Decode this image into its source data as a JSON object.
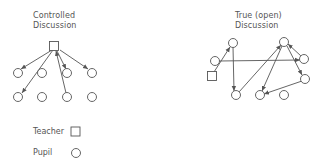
{
  "diagrams": [
    {
      "id": "controlled",
      "title_lines": [
        "Controlled",
        "Discussion"
      ],
      "teacher": {
        "x": 54,
        "y": 46
      },
      "pupils": [
        {
          "x": 18,
          "y": 73
        },
        {
          "x": 42,
          "y": 73
        },
        {
          "x": 67,
          "y": 73
        },
        {
          "x": 92,
          "y": 73
        },
        {
          "x": 18,
          "y": 97
        },
        {
          "x": 42,
          "y": 97
        },
        {
          "x": 67,
          "y": 97
        },
        {
          "x": 92,
          "y": 97
        }
      ],
      "arrows": [
        {
          "from": [
            52,
            50
          ],
          "to": [
            21,
            69
          ]
        },
        {
          "from": [
            53,
            50
          ],
          "to": [
            22,
            93
          ]
        },
        {
          "from": [
            66,
            93
          ],
          "to": [
            56,
            51
          ]
        },
        {
          "from": [
            57,
            51
          ],
          "to": [
            66,
            69
          ]
        },
        {
          "from": [
            60,
            50
          ],
          "to": [
            88,
            69
          ]
        }
      ]
    },
    {
      "id": "open",
      "title_lines": [
        "True (open)",
        "Discussion"
      ],
      "teacher": {
        "x": 212,
        "y": 76
      },
      "pupils": [
        {
          "x": 233,
          "y": 43
        },
        {
          "x": 215,
          "y": 61
        },
        {
          "x": 284,
          "y": 42
        },
        {
          "x": 304,
          "y": 59
        },
        {
          "x": 305,
          "y": 79
        },
        {
          "x": 236,
          "y": 95
        },
        {
          "x": 260,
          "y": 95
        },
        {
          "x": 284,
          "y": 95
        }
      ],
      "arrows": [
        {
          "from": [
            214,
            72
          ],
          "to": [
            230,
            47
          ]
        },
        {
          "from": [
            233,
            47
          ],
          "to": [
            234,
            91
          ]
        },
        {
          "from": [
            219,
            61
          ],
          "to": [
            300,
            60
          ]
        },
        {
          "from": [
            239,
            92
          ],
          "to": [
            281,
            45
          ]
        },
        {
          "from": [
            282,
            46
          ],
          "to": [
            262,
            91
          ]
        },
        {
          "from": [
            287,
            46
          ],
          "to": [
            302,
            75
          ]
        },
        {
          "from": [
            301,
            56
          ],
          "to": [
            288,
            44
          ]
        },
        {
          "from": [
            302,
            81
          ],
          "to": [
            264,
            94
          ]
        }
      ]
    }
  ],
  "legend": {
    "items": [
      {
        "label": "Teacher",
        "symbol": "square"
      },
      {
        "label": "Pupil",
        "symbol": "circle"
      }
    ]
  },
  "colors": {
    "stroke": "#555555",
    "background": "#ffffff"
  }
}
